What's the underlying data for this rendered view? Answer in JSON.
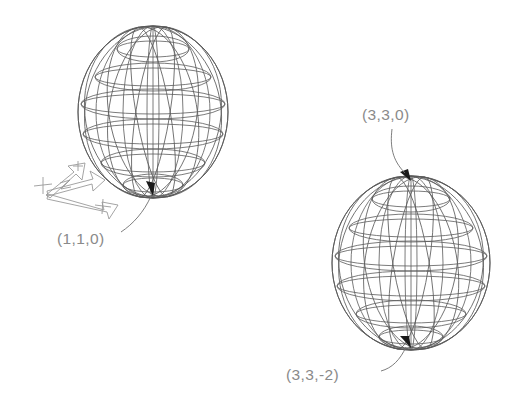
{
  "drawing": {
    "title": "Wireframe sphere coordinate diagram",
    "background_color": "#ffffff",
    "line_color": "#5a5a5a",
    "label_color": "#8a8a8a",
    "arrow_color": "#1a1a1a"
  },
  "labels": {
    "left_sphere_bottom": "(1,1,0)",
    "right_sphere_top": "(3,3,0)",
    "right_sphere_bottom": "(3,3,-2)"
  },
  "axis_triad": {
    "name": "ucs-axis-indicator",
    "axes": [
      {
        "id": "z",
        "label": "+Z",
        "direction": "up"
      },
      {
        "id": "y",
        "label": "+Y",
        "direction": "up-right"
      },
      {
        "id": "x",
        "label": "+X",
        "direction": "down-right"
      }
    ]
  },
  "spheres": [
    {
      "id": "left-sphere",
      "label": "(1,1,0)",
      "center_x": 153,
      "center_y": 112,
      "radius_x": 75,
      "radius_y": 86,
      "latitudes": 6,
      "meridians": 8,
      "marked_point": "bottom-pole"
    },
    {
      "id": "right-sphere",
      "label": "(3,3,0)",
      "center_x": 411,
      "center_y": 263,
      "radius_x": 79,
      "radius_y": 87,
      "latitudes": 6,
      "meridians": 8,
      "marked_point": "both-poles"
    }
  ]
}
